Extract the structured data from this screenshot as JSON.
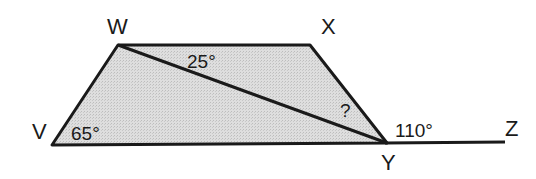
{
  "diagram": {
    "type": "geometry",
    "colors": {
      "fill": "#d9d9d9",
      "stroke": "#1a1a1a",
      "background": "#ffffff"
    },
    "vertices": {
      "W": {
        "label": "W"
      },
      "X": {
        "label": "X"
      },
      "V": {
        "label": "V"
      },
      "Y": {
        "label": "Y"
      },
      "Z": {
        "label": "Z"
      }
    },
    "angles": {
      "wyx_diag": {
        "label": "25°",
        "location": "at W between WX and WY"
      },
      "unknown": {
        "label": "?",
        "location": "at Y between WY and XY"
      },
      "v_angle": {
        "label": "65°",
        "location": "at V"
      },
      "exterior": {
        "label": "110°",
        "location": "at Y between XY and YZ"
      }
    },
    "segments": [
      "VW",
      "WX",
      "XY",
      "YV",
      "WY",
      "YZ"
    ]
  }
}
